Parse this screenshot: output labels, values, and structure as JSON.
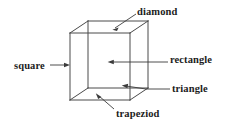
{
  "figure": {
    "type": "line-drawing",
    "background_color": "#ffffff",
    "line_color": "#4a4a4a",
    "text_color": "#1c1c1c",
    "width": 226,
    "height": 127
  },
  "labels": [
    {
      "id": "diamond",
      "text": "diamond",
      "position": "top-right",
      "leader": "arrow pointing down-left to the top face of the cube"
    },
    {
      "id": "square",
      "text": "square",
      "position": "left",
      "leader": "horizontal arrow pointing right to the front-left edge of the cube"
    },
    {
      "id": "rectangle",
      "text": "rectangle",
      "position": "right-middle",
      "leader": "horizontal line ending in an arrow at the centre of the front face"
    },
    {
      "id": "triangle",
      "text": "triangle",
      "position": "right-lower",
      "leader": "line angling up-left to an arrow near the lower-right of the cube"
    },
    {
      "id": "trapeziod",
      "text": "trapeziod",
      "position": "bottom",
      "leader": "diagonal line up-left to an arrow on the bottom face of the cube"
    }
  ],
  "cube": {
    "description": "transparent cube drawn in parallel (oblique) projection, all twelve edges visible",
    "front_face": {
      "top_left": [
        70,
        33
      ],
      "top_right": [
        130,
        33
      ],
      "bottom_right": [
        130,
        100
      ],
      "bottom_left": [
        70,
        100
      ]
    },
    "back_face": {
      "top_left": [
        88,
        21
      ],
      "top_right": [
        148,
        21
      ],
      "bottom_right": [
        148,
        88
      ],
      "bottom_left": [
        88,
        88
      ]
    }
  }
}
